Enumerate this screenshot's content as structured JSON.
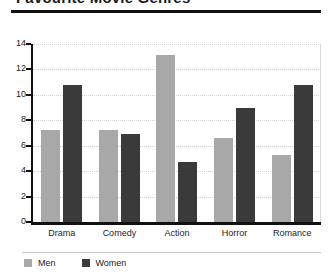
{
  "chart_data": {
    "type": "bar",
    "title": "Favourite Movie Genres",
    "title_clipped": true,
    "xlabel": "",
    "ylabel": "",
    "ylim": [
      0,
      14
    ],
    "yticks": [
      0,
      2,
      4,
      6,
      8,
      10,
      12,
      14
    ],
    "grid": true,
    "legend_position": "bottom-left",
    "categories": [
      "Drama",
      "Comedy",
      "Action",
      "Horror",
      "Romance"
    ],
    "series": [
      {
        "name": "Men",
        "color": "#a8a8a8",
        "values": [
          7.2,
          7.2,
          13.1,
          6.6,
          5.3
        ]
      },
      {
        "name": "Women",
        "color": "#3a3a3a",
        "values": [
          10.8,
          6.9,
          4.7,
          9.0,
          10.8
        ]
      }
    ]
  },
  "axis": {
    "tick_labels": [
      "14",
      "12",
      "10",
      "8",
      "6",
      "4",
      "2",
      "0"
    ]
  },
  "legend": {
    "items": [
      {
        "label": "Men"
      },
      {
        "label": "Women"
      }
    ]
  }
}
